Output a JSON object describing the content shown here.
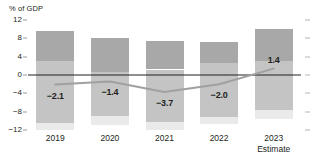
{
  "chart_data": {
    "type": "bar",
    "title": "",
    "subtitle": "",
    "xlabel": "",
    "ylabel": "% of GDP",
    "ylim": [
      -12,
      12
    ],
    "yticks": [
      12,
      8,
      4,
      0,
      -4,
      -8,
      -12
    ],
    "ytick_labels": [
      "12",
      "8",
      "4",
      "0",
      "−4",
      "−8",
      "−12"
    ],
    "grid": false,
    "legend": "none",
    "categories": [
      "2019",
      "2020",
      "2021",
      "2022",
      "2023"
    ],
    "category_sublabels": [
      "",
      "",
      "",
      "",
      "Estimate"
    ],
    "series": [
      {
        "name": "revenue-range-top",
        "type": "bar",
        "segment": "top",
        "color": "#a8a8a8",
        "from": [
          3.0,
          0.6,
          1.2,
          2.6,
          3.0
        ],
        "to": [
          9.5,
          8.0,
          7.4,
          7.2,
          10.1
        ]
      },
      {
        "name": "revenue-range-middle",
        "type": "bar",
        "segment": "middle",
        "color": "#c4c4c4",
        "from": [
          -10.4,
          -8.9,
          -10.2,
          -9.2,
          -7.6
        ],
        "to": [
          3.0,
          0.6,
          1.2,
          2.6,
          3.0
        ]
      },
      {
        "name": "revenue-range-bottom",
        "type": "bar",
        "segment": "bottom",
        "color": "#eaeaea",
        "from": [
          -12.0,
          -11.0,
          -11.9,
          -10.8,
          -9.6
        ],
        "to": [
          -10.4,
          -8.9,
          -10.2,
          -9.2,
          -7.6
        ]
      },
      {
        "name": "balance",
        "type": "line",
        "color": "#a0a0a0",
        "values": [
          -2.1,
          -1.4,
          -3.7,
          -2.0,
          1.4
        ],
        "labels": [
          "−2.1",
          "−1.4",
          "−3.7",
          "−2.0",
          "1.4"
        ]
      }
    ],
    "data_labels": [
      {
        "category": "2019",
        "text": "−2.1",
        "value": -2.1
      },
      {
        "category": "2020",
        "text": "−1.4",
        "value": -1.4
      },
      {
        "category": "2021",
        "text": "−3.7",
        "value": -3.7
      },
      {
        "category": "2022",
        "text": "−2.0",
        "value": -2.0
      },
      {
        "category": "2023",
        "text": "1.4",
        "value": 1.4
      }
    ],
    "colors": {
      "segment_top": "#a8a8a8",
      "segment_middle": "#c4c4c4",
      "segment_bottom": "#eaeaea",
      "line": "#a0a0a0",
      "zero_line": "#231f20",
      "text": "#231f20",
      "background": "#ffffff"
    },
    "right_axis_ticks": true
  }
}
